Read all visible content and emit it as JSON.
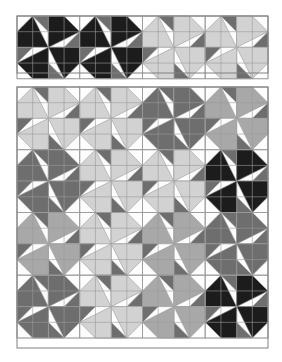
{
  "document": {
    "title": "Quilt Star Block Layout",
    "background_color": "#ffffff"
  },
  "palette": {
    "background": "#ffffff",
    "patch_white": "#fdfdfd",
    "patch_light_gray": "#d2d2d2",
    "patch_medium_gray": "#a8a8a8",
    "patch_dark_gray": "#6e6e6e",
    "patch_black": "#1c1c1c",
    "seam_line": "#9a9a9a",
    "frame_line": "#808080"
  },
  "chart_data": {
    "type": "diagram",
    "subtype": "pieced-quilt-block-diagram",
    "block_motif": "swirling star (four rotated quadrant units)",
    "panels": [
      {
        "name": "top-border-strip",
        "role": "border strip / block row sample",
        "x": 17,
        "y": 16,
        "width": 251,
        "height": 57,
        "rows": 1,
        "columns": 4,
        "block_size": 62.75,
        "blocks": [
          {
            "index": 0,
            "row": 0,
            "col": 0,
            "star_color": "patch_black",
            "accent_color": "patch_dark_gray",
            "ground_color": "patch_white"
          },
          {
            "index": 1,
            "row": 0,
            "col": 1,
            "star_color": "patch_black",
            "accent_color": "patch_dark_gray",
            "ground_color": "patch_white"
          },
          {
            "index": 2,
            "row": 0,
            "col": 2,
            "star_color": "patch_light_gray",
            "accent_color": "patch_dark_gray",
            "ground_color": "patch_white"
          },
          {
            "index": 3,
            "row": 0,
            "col": 3,
            "star_color": "patch_light_gray",
            "accent_color": "patch_dark_gray",
            "ground_color": "patch_white"
          }
        ]
      },
      {
        "name": "main-quilt-panel",
        "role": "full quilt top layout",
        "x": 17,
        "y": 87,
        "width": 251,
        "height": 261,
        "rows": 4,
        "columns": 4,
        "block_size": 62.75,
        "blocks": [
          {
            "index": 0,
            "row": 0,
            "col": 0,
            "star_color": "patch_light_gray",
            "accent_color": "patch_dark_gray",
            "ground_color": "patch_white"
          },
          {
            "index": 1,
            "row": 0,
            "col": 1,
            "star_color": "patch_light_gray",
            "accent_color": "patch_dark_gray",
            "ground_color": "patch_white"
          },
          {
            "index": 2,
            "row": 0,
            "col": 2,
            "star_color": "patch_dark_gray",
            "accent_color": "patch_dark_gray",
            "ground_color": "patch_white"
          },
          {
            "index": 3,
            "row": 0,
            "col": 3,
            "star_color": "patch_medium_gray",
            "accent_color": "patch_dark_gray",
            "ground_color": "patch_white"
          },
          {
            "index": 4,
            "row": 1,
            "col": 0,
            "star_color": "patch_dark_gray",
            "accent_color": "patch_dark_gray",
            "ground_color": "patch_white"
          },
          {
            "index": 5,
            "row": 1,
            "col": 1,
            "star_color": "patch_light_gray",
            "accent_color": "patch_dark_gray",
            "ground_color": "patch_white"
          },
          {
            "index": 6,
            "row": 1,
            "col": 2,
            "star_color": "patch_light_gray",
            "accent_color": "patch_dark_gray",
            "ground_color": "patch_white"
          },
          {
            "index": 7,
            "row": 1,
            "col": 3,
            "star_color": "patch_black",
            "accent_color": "patch_dark_gray",
            "ground_color": "patch_white"
          },
          {
            "index": 8,
            "row": 2,
            "col": 0,
            "star_color": "patch_medium_gray",
            "accent_color": "patch_dark_gray",
            "ground_color": "patch_white"
          },
          {
            "index": 9,
            "row": 2,
            "col": 1,
            "star_color": "patch_light_gray",
            "accent_color": "patch_dark_gray",
            "ground_color": "patch_white"
          },
          {
            "index": 10,
            "row": 2,
            "col": 2,
            "star_color": "patch_medium_gray",
            "accent_color": "patch_dark_gray",
            "ground_color": "patch_white"
          },
          {
            "index": 11,
            "row": 2,
            "col": 3,
            "star_color": "patch_dark_gray",
            "accent_color": "patch_dark_gray",
            "ground_color": "patch_white"
          },
          {
            "index": 12,
            "row": 3,
            "col": 0,
            "star_color": "patch_dark_gray",
            "accent_color": "patch_dark_gray",
            "ground_color": "patch_white"
          },
          {
            "index": 13,
            "row": 3,
            "col": 1,
            "star_color": "patch_light_gray",
            "accent_color": "patch_dark_gray",
            "ground_color": "patch_white"
          },
          {
            "index": 14,
            "row": 3,
            "col": 2,
            "star_color": "patch_medium_gray",
            "accent_color": "patch_dark_gray",
            "ground_color": "patch_white"
          },
          {
            "index": 15,
            "row": 3,
            "col": 3,
            "star_color": "patch_black",
            "accent_color": "patch_dark_gray",
            "ground_color": "patch_white"
          }
        ]
      }
    ]
  }
}
